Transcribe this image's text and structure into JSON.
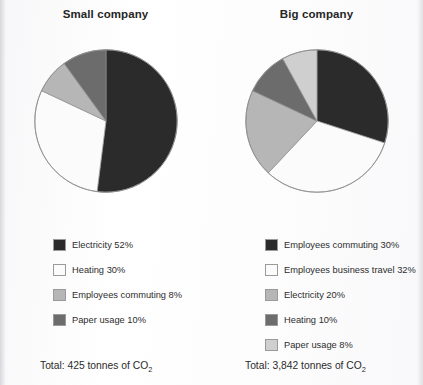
{
  "page": {
    "background": "#ffffff",
    "text_color": "#2a2a2a"
  },
  "palette": {
    "dark": "#2b2b2b",
    "white": "#fbfbfb",
    "light_gray": "#b6b6b6",
    "mid_dark_gray": "#6c6c6c",
    "pale_gray": "#cfcfcf",
    "outline": "#8e8e8e"
  },
  "panels": {
    "left": {
      "title": "Small company",
      "total_prefix": "Total: 425 tonnes of CO",
      "total_sub": "2",
      "legend": [
        {
          "label": "Electricity 52%",
          "swatch": "#2b2b2b"
        },
        {
          "label": "Heating 30%",
          "swatch": "#fbfbfb"
        },
        {
          "label": "Employees commuting 8%",
          "swatch": "#b6b6b6"
        },
        {
          "label": "Paper usage 10%",
          "swatch": "#6c6c6c"
        }
      ]
    },
    "right": {
      "title": "Big company",
      "total_prefix": "Total: 3,842 tonnes of CO",
      "total_sub": "2",
      "legend": [
        {
          "label": "Employees commuting 30%",
          "swatch": "#2b2b2b"
        },
        {
          "label": "Employees business travel 32%",
          "swatch": "#fbfbfb"
        },
        {
          "label": "Electricity 20%",
          "swatch": "#b6b6b6"
        },
        {
          "label": "Heating 10%",
          "swatch": "#6c6c6c"
        },
        {
          "label": "Paper usage 8%",
          "swatch": "#cfcfcf"
        }
      ]
    }
  },
  "chart_data": [
    {
      "type": "pie",
      "title": "Small company",
      "categories": [
        "Electricity",
        "Heating",
        "Employees commuting",
        "Paper usage"
      ],
      "values": [
        52,
        30,
        8,
        10
      ],
      "unit": "%",
      "colors": [
        "#2b2b2b",
        "#fbfbfb",
        "#b6b6b6",
        "#6c6c6c"
      ],
      "start_angle_deg": 0,
      "direction": "clockwise",
      "legend_position": "bottom",
      "annotation": "Total: 425 tonnes of CO2",
      "total": 425,
      "total_unit": "tonnes of CO2"
    },
    {
      "type": "pie",
      "title": "Big company",
      "categories": [
        "Employees commuting",
        "Employees business travel",
        "Electricity",
        "Heating",
        "Paper usage"
      ],
      "values": [
        30,
        32,
        20,
        10,
        8
      ],
      "unit": "%",
      "colors": [
        "#2b2b2b",
        "#fbfbfb",
        "#b6b6b6",
        "#6c6c6c",
        "#cfcfcf"
      ],
      "start_angle_deg": 0,
      "direction": "clockwise",
      "legend_position": "bottom",
      "annotation": "Total: 3,842 tonnes of CO2",
      "total": 3842,
      "total_unit": "tonnes of CO2"
    }
  ]
}
